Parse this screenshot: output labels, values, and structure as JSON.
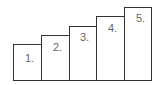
{
  "diagram": {
    "stroke_color": "#333333",
    "label_color": "#666666",
    "steps": [
      {
        "label": "1.",
        "level": 1
      },
      {
        "label": "2.",
        "level": 2
      },
      {
        "label": "3.",
        "level": 3
      },
      {
        "label": "4.",
        "level": 4
      },
      {
        "label": "5.",
        "level": 5
      }
    ]
  }
}
